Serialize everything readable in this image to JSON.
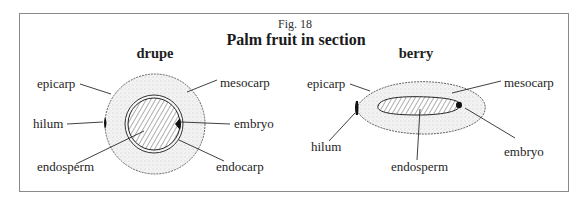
{
  "figure": {
    "number": "Fig. 18",
    "title": "Palm fruit in section"
  },
  "drupe": {
    "heading": "drupe",
    "labels": {
      "epicarp": "epicarp",
      "hilum": "hilum",
      "endosperm": "endosperm",
      "mesocarp": "mesocarp",
      "embryo": "embryo",
      "endocarp": "endocarp"
    }
  },
  "berry": {
    "heading": "berry",
    "labels": {
      "epicarp": "epicarp",
      "hilum": "hilum",
      "endosperm": "endosperm",
      "mesocarp": "mesocarp",
      "embryo": "embryo"
    }
  },
  "colors": {
    "border": "#8a8a8a",
    "ink": "#1e1e1e",
    "stipple": "#e9e9e9"
  }
}
